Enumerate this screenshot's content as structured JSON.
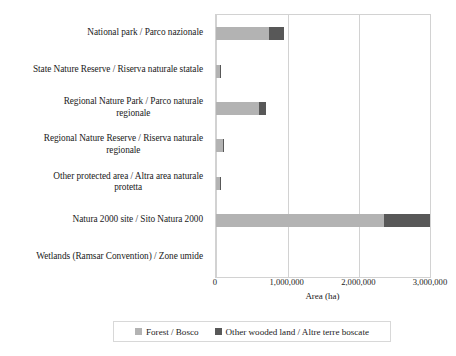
{
  "chart_data": {
    "type": "bar",
    "orientation": "horizontal",
    "stacked": true,
    "title": "",
    "xlabel": "Area (ha)",
    "ylabel": "",
    "xlim": [
      0,
      3000000
    ],
    "xticks": [
      0,
      1000000,
      2000000,
      3000000
    ],
    "xtick_labels": [
      "0",
      "1,000,000",
      "2,000,000",
      "3,000,000"
    ],
    "grid": "vertical",
    "legend_position": "bottom",
    "categories": [
      "National park / Parco nazionale",
      "State Nature Reserve / Riserva naturale statale",
      "Regional Nature Park / Parco naturale regionale",
      "Regional Nature Reserve / Riserva naturale regionale",
      "Other protected area / Altra area naturale protetta",
      "Natura 2000 site / Sito Natura 2000",
      "Wetlands (Ramsar Convention) / Zone umide"
    ],
    "category_lines": [
      [
        "National park / Parco nazionale"
      ],
      [
        "State Nature Reserve / Riserva naturale statale"
      ],
      [
        "Regional Nature Park / Parco naturale",
        "regionale"
      ],
      [
        "Regional Nature Reserve / Riserva naturale",
        "regionale"
      ],
      [
        "Other protected area / Altra area naturale",
        "protetta"
      ],
      [
        "Natura 2000 site / Sito Natura 2000"
      ],
      [
        "Wetlands (Ramsar Convention) / Zone umide"
      ]
    ],
    "series": [
      {
        "name": "Forest / Bosco",
        "color": "#b3b3b3",
        "values": [
          740000,
          55000,
          600000,
          95000,
          50000,
          2350000,
          0
        ]
      },
      {
        "name": "Other wooded land / Altre terre boscate",
        "color": "#585858",
        "values": [
          210000,
          10000,
          100000,
          10000,
          5000,
          630000,
          0
        ]
      }
    ]
  },
  "legend": {
    "items": [
      {
        "label": "Forest / Bosco",
        "color": "#b3b3b3"
      },
      {
        "label": "Other wooded land / Altre terre boscate",
        "color": "#585858"
      }
    ]
  },
  "axis": {
    "x_title": "Area (ha)"
  }
}
